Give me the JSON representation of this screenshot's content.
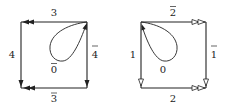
{
  "diagrams": [
    {
      "name": "left-square",
      "arrow_style": "filled",
      "edges": {
        "top": {
          "label": "3",
          "overline": false,
          "direction": "left",
          "heads": 2
        },
        "left": {
          "label": "4",
          "overline": false,
          "direction": "down",
          "heads": 1
        },
        "right": {
          "label": "4",
          "overline": true,
          "direction": "down",
          "heads": 1
        },
        "bottom": {
          "label": "3",
          "overline": true,
          "direction": "left",
          "heads": 2
        }
      },
      "loop": {
        "label": "0",
        "overline": true,
        "corner": "top-right"
      }
    },
    {
      "name": "right-square",
      "arrow_style": "hollow",
      "edges": {
        "top": {
          "label": "2",
          "overline": true,
          "direction": "right",
          "heads": 2
        },
        "left": {
          "label": "1",
          "overline": false,
          "direction": "down",
          "heads": 1
        },
        "right": {
          "label": "1",
          "overline": true,
          "direction": "down",
          "heads": 1
        },
        "bottom": {
          "label": "2",
          "overline": false,
          "direction": "right",
          "heads": 2
        }
      },
      "loop": {
        "label": "0",
        "overline": false,
        "corner": "top-left"
      }
    }
  ],
  "colors": {
    "stroke": "#222222",
    "background": "#ffffff"
  }
}
